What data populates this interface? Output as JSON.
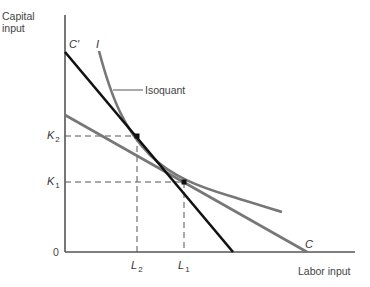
{
  "figure": {
    "y_axis_label_line1": "Capital",
    "y_axis_label_line2": "input",
    "x_axis_label": "Labor input",
    "origin_label": "0",
    "isoquant_label": "Isoquant",
    "isoquant_curve_label": "I",
    "line_c_prime_label": "C'",
    "line_c_label": "C",
    "k2_label": "K",
    "k2_sub": "2",
    "k1_label": "K",
    "k1_sub": "1",
    "l2_label": "L",
    "l2_sub": "2",
    "l1_label": "L",
    "l1_sub": "1"
  },
  "colors": {
    "axis": "#555555",
    "line_c_prime": "#111111",
    "line_c": "#777777",
    "isoquant": "#777777",
    "dashed": "#555555"
  }
}
